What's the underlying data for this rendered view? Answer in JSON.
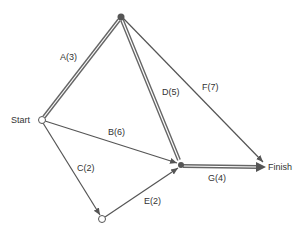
{
  "diagram": {
    "type": "pert-network",
    "nodes": [
      {
        "id": "start",
        "label": "Start",
        "x": 42,
        "y": 120,
        "style": "open"
      },
      {
        "id": "n1",
        "label": "",
        "x": 121,
        "y": 17,
        "style": "filled"
      },
      {
        "id": "n2",
        "label": "",
        "x": 102,
        "y": 219,
        "style": "open"
      },
      {
        "id": "n3",
        "label": "",
        "x": 181,
        "y": 165,
        "style": "filled"
      },
      {
        "id": "finish",
        "label": "Finish",
        "x": 266,
        "y": 167,
        "style": "none"
      }
    ],
    "edges": [
      {
        "id": "A",
        "label": "A(3)",
        "from": "start",
        "to": "n1",
        "critical": true
      },
      {
        "id": "B",
        "label": "B(6)",
        "from": "start",
        "to": "n3",
        "critical": false
      },
      {
        "id": "C",
        "label": "C(2)",
        "from": "start",
        "to": "n2",
        "critical": false
      },
      {
        "id": "D",
        "label": "D(5)",
        "from": "n1",
        "to": "n3",
        "critical": true
      },
      {
        "id": "E",
        "label": "E(2)",
        "from": "n2",
        "to": "n3",
        "critical": false
      },
      {
        "id": "F",
        "label": "F(7)",
        "from": "n1",
        "to": "finish",
        "critical": false
      },
      {
        "id": "G",
        "label": "G(4)",
        "from": "n3",
        "to": "finish",
        "critical": true
      }
    ],
    "colors": {
      "line": "#555555",
      "text": "#333333",
      "background": "#ffffff"
    }
  }
}
